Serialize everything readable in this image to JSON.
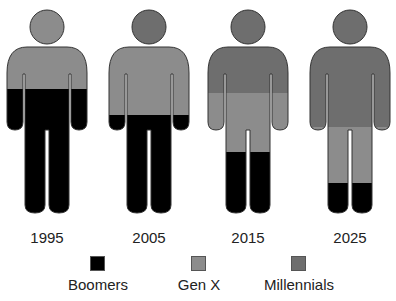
{
  "colors": {
    "Boomers": "#000000",
    "Gen X": "#8c8c8c",
    "Millennials": "#6e6e6e"
  },
  "figures": [
    {
      "year": "1995",
      "cx": 47,
      "boomers_top": 89,
      "genx_top": 47,
      "head": "Gen X"
    },
    {
      "year": "2005",
      "cx": 149,
      "boomers_top": 115,
      "genx_top": 47,
      "head": "Millennials"
    },
    {
      "year": "2015",
      "cx": 248,
      "boomers_top": 152,
      "genx_top": 93,
      "head": "Millennials"
    },
    {
      "year": "2025",
      "cx": 350,
      "boomers_top": 183,
      "genx_top": 127,
      "head": "Millennials"
    }
  ],
  "legend": [
    {
      "label": "Boomers",
      "color": "#000000"
    },
    {
      "label": "Gen X",
      "color": "#8c8c8c"
    },
    {
      "label": "Millennials",
      "color": "#6e6e6e"
    }
  ]
}
